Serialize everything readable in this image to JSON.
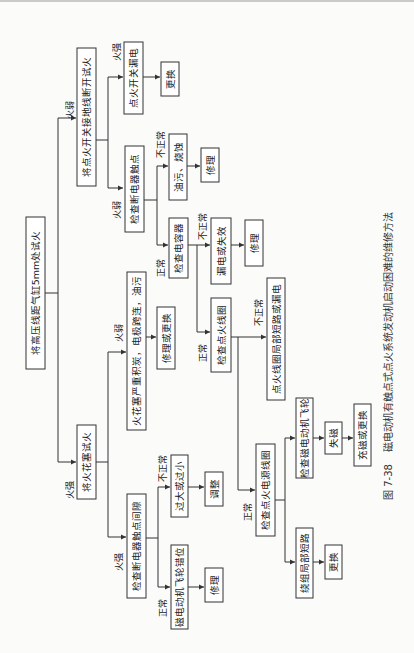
{
  "figure": {
    "caption_number": "图 7-38",
    "caption_title": "磁电动机有触点式点火系统发动机启动困难的维修方法",
    "orientation": "rotated 90° counter-clockwise"
  },
  "nodes": {
    "root": "将高压线距气缸5mm处试火",
    "n_switch_test": "将点火开关接地线断开试火",
    "n_switch_leak": "点火开关漏电",
    "n_switch_replace": "更换",
    "n_check_contact": "检查断电器触点",
    "n_oil_burn": "油污、烧蚀",
    "n_oil_repair": "修理",
    "n_check_cap": "检查电容器",
    "n_cap_fail": "漏电或失效",
    "n_cap_repair": "修理",
    "n_check_coil": "检查点火线圈",
    "n_coil_short": "点火线圈局部短路或漏电",
    "n_plug_test": "将火花塞试火",
    "n_plug_carbon": "火花塞严重积炭，电极跨连，油污",
    "n_plug_fix": "修理或更换",
    "n_check_gap": "检查断电器触点间隙",
    "n_gap_bad": "过大或过小",
    "n_gap_adjust": "调整",
    "n_flywheel_slip": "磁电动机飞轮错位",
    "n_flywheel_repair": "修理",
    "n_check_source_coil": "检查点火电源线圈",
    "n_check_flywheel": "检查磁电动机飞轮",
    "n_demag": "失磁",
    "n_remag": "充磁或更换",
    "n_winding_short": "绕组局部短路",
    "n_winding_replace": "更换"
  },
  "edge_labels": {
    "weak_spark": "火弱",
    "strong_spark": "火强",
    "normal": "正常",
    "abnormal": "不正常"
  }
}
